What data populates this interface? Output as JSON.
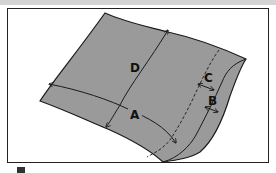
{
  "diagram": {
    "type": "garment-measurement-diagram",
    "labels": {
      "A": "A",
      "B": "B",
      "C": "C",
      "D": "D"
    },
    "colors": {
      "fabric_fill": "#9a9a9a",
      "outline": "#1a1a1a",
      "frame_border": "#222222",
      "background": "#ffffff"
    },
    "annotations": [
      {
        "label": "A",
        "description": "curved width measurement across the fabric, arrow from left edge to hem"
      },
      {
        "label": "B",
        "description": "short arrow across the folded hem edge"
      },
      {
        "label": "C",
        "description": "short arrow from dashed stitch line to hem fold"
      },
      {
        "label": "D",
        "description": "curved length measurement from top edge to bottom edge"
      }
    ],
    "dashed_line": "stitch line parallel to hem"
  }
}
